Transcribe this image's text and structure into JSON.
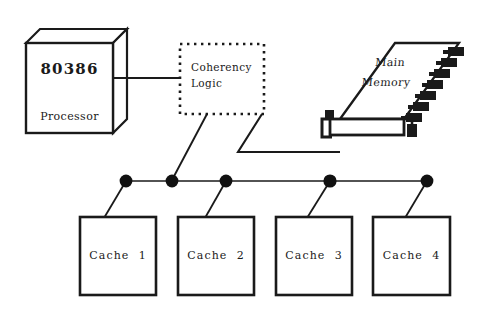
{
  "diagram": {
    "colors": {
      "ink": "#1a1a1a",
      "background": "#ffffff",
      "node_dot": "#111111"
    },
    "processor": {
      "chip_label": "80386",
      "role_label": "Processor",
      "shape": "3d-box"
    },
    "coherency": {
      "line1": "Coherency",
      "line2": "Logic",
      "border_style": "dotted"
    },
    "memory": {
      "line1": "Main",
      "line2": "Memory",
      "shape": "memory-board",
      "chip_count": 8
    },
    "bus": {
      "name": "system bus",
      "dot_count": 5
    },
    "caches": [
      {
        "label": "Cache  1"
      },
      {
        "label": "Cache  2"
      },
      {
        "label": "Cache  3"
      },
      {
        "label": "Cache  4"
      }
    ]
  }
}
